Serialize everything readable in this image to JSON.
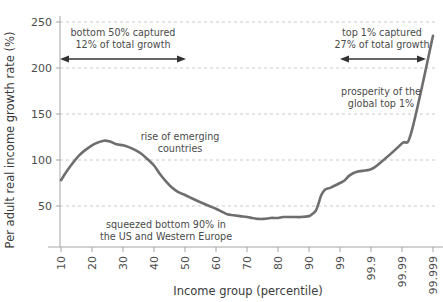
{
  "chart_data": {
    "type": "line",
    "title": "",
    "xlabel": "Income group (percentile)",
    "ylabel": "Per adult real income growth rate (%)",
    "xtick_labels": [
      "10",
      "20",
      "30",
      "40",
      "50",
      "60",
      "70",
      "80",
      "90",
      "99",
      "99.9",
      "99.99",
      "99.999"
    ],
    "ytick_labels": [
      "50",
      "100",
      "150",
      "200",
      "250"
    ],
    "ylim": [
      0,
      260
    ],
    "yticks": [
      50,
      100,
      150,
      200,
      250
    ],
    "grid": "horizontal-dashed",
    "legend": "none",
    "line_color": "#6e6e6e",
    "grid_color": "#c8c8c8",
    "axis_color": "#9a9a9a",
    "series": [
      {
        "name": "Per adult real income growth rate",
        "x": [
          "10",
          "12",
          "14",
          "16",
          "18",
          "20",
          "22",
          "24",
          "26",
          "28",
          "30",
          "32",
          "34",
          "36",
          "38",
          "40",
          "42",
          "44",
          "46",
          "48",
          "50",
          "52",
          "54",
          "56",
          "58",
          "60",
          "62",
          "64",
          "66",
          "68",
          "70",
          "72",
          "74",
          "76",
          "78",
          "80",
          "82",
          "84",
          "86",
          "88",
          "90",
          "92",
          "94",
          "95",
          "96",
          "97",
          "98",
          "99",
          "99.3",
          "99.5",
          "99.7",
          "99.9",
          "99.95",
          "99.99",
          "99.995",
          "99.999"
        ],
        "values": [
          78,
          88,
          97,
          105,
          111,
          116,
          119,
          121,
          120,
          117,
          116,
          114,
          111,
          107,
          101,
          94,
          85,
          77,
          70,
          65,
          62,
          59,
          56,
          53,
          50,
          47,
          44,
          41,
          40,
          39,
          38,
          37,
          36,
          36,
          37,
          37,
          38,
          38,
          38,
          38,
          39,
          41,
          45,
          52,
          62,
          68,
          70,
          75,
          78,
          83,
          87,
          90,
          97,
          118,
          130,
          235
        ]
      }
    ],
    "annotations": [
      {
        "id": "bottom-50-annotation",
        "line1": "bottom 50% captured",
        "line2": "12% of total growth",
        "arrow": "double-headed",
        "arrow_from_x": "10",
        "arrow_to_x": "50"
      },
      {
        "id": "top-1-annotation",
        "line1": "top 1% captured",
        "line2": "27% of total growth",
        "arrow": "double-headed",
        "arrow_from_x": "99",
        "arrow_to_x": "99.999"
      },
      {
        "id": "rise-emerging-annotation",
        "line1": "rise of emerging",
        "line2": "countries",
        "arrow": "none"
      },
      {
        "id": "squeezed-bottom-annotation",
        "line1": "squeezed bottom 90% in",
        "line2": "the US and Western Europe",
        "arrow": "none"
      },
      {
        "id": "prosperity-top-annotation",
        "line1": "prosperity of the",
        "line2": "global top 1%",
        "arrow": "none"
      }
    ]
  }
}
